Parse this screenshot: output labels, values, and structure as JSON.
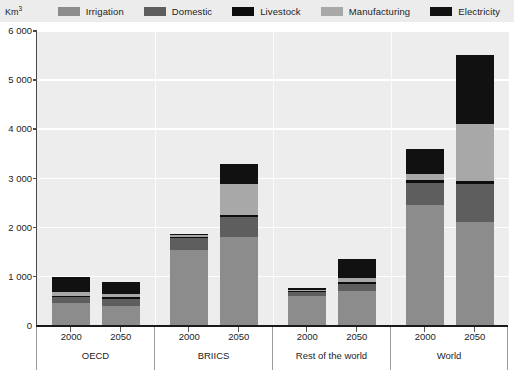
{
  "axis": {
    "unit": "Km",
    "unit_exponent": "3",
    "y_ticks": [
      "6 000",
      "5 000",
      "4 000",
      "3 000",
      "2 000",
      "1 000",
      "0"
    ],
    "y_tick_values": [
      6000,
      5000,
      4000,
      3000,
      2000,
      1000,
      0
    ]
  },
  "legend": {
    "items": [
      {
        "label": "Irrigation",
        "color": "#8c8c8c"
      },
      {
        "label": "Domestic",
        "color": "#5e5e5e"
      },
      {
        "label": "Livestock",
        "color": "#0d0d0d"
      },
      {
        "label": "Manufacturing",
        "color": "#a8a8a8"
      },
      {
        "label": "Electricity",
        "color": "#111111"
      }
    ]
  },
  "chart_data": {
    "type": "bar",
    "title": "",
    "xlabel": "",
    "ylabel": "Km3",
    "ylim": [
      0,
      6000
    ],
    "grid": true,
    "legend_position": "top",
    "stacked": true,
    "groups": [
      {
        "name": "OECD",
        "years": [
          "2000",
          "2050"
        ]
      },
      {
        "name": "BRIICS",
        "years": [
          "2000",
          "2050"
        ]
      },
      {
        "name": "Rest of the world",
        "years": [
          "2000",
          "2050"
        ]
      },
      {
        "name": "World",
        "years": [
          "2000",
          "2050"
        ]
      }
    ],
    "categories": [
      "OECD 2000",
      "OECD 2050",
      "BRIICS 2000",
      "BRIICS 2050",
      "Rest of the world 2000",
      "Rest of the world 2050",
      "World 2000",
      "World 2050"
    ],
    "series": [
      {
        "name": "Irrigation",
        "color": "#8c8c8c",
        "values": [
          440,
          390,
          1530,
          1780,
          600,
          690,
          2450,
          2100
        ]
      },
      {
        "name": "Domestic",
        "color": "#5e5e5e",
        "values": [
          130,
          140,
          240,
          420,
          70,
          150,
          440,
          760
        ]
      },
      {
        "name": "Livestock",
        "color": "#0d0d0d",
        "values": [
          30,
          30,
          30,
          40,
          30,
          30,
          50,
          60
        ]
      },
      {
        "name": "Manufacturing",
        "color": "#a8a8a8",
        "values": [
          80,
          70,
          30,
          620,
          20,
          80,
          130,
          1170
        ]
      },
      {
        "name": "Electricity",
        "color": "#111111",
        "values": [
          290,
          250,
          30,
          420,
          30,
          400,
          510,
          1410
        ]
      }
    ],
    "totals": [
      970,
      880,
      1860,
      3280,
      750,
      1350,
      3580,
      5500
    ]
  }
}
